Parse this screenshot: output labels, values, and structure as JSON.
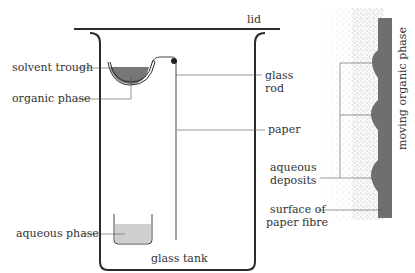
{
  "diagram": {
    "labels": {
      "lid": "lid",
      "solvent_trough": "solvent trough",
      "organic_phase": "organic phase",
      "glass_rod_line1": "glass",
      "glass_rod_line2": "rod",
      "paper": "paper",
      "aqueous_phase": "aqueous phase",
      "glass_tank": "glass tank",
      "aqueous_deposits_line1": "aqueous",
      "aqueous_deposits_line2": "deposits",
      "surface_line1": "surface of",
      "surface_line2": "paper fibre",
      "moving_organic_phase": "moving organic phase"
    },
    "colors": {
      "outline": "#2b2b2b",
      "organic_fill": "#777777",
      "aqueous_fill": "#cfcfcf",
      "fibre_band": "#6f6f6f",
      "deposit_fill": "#c8c8c8",
      "stipple": "#9a9a9a",
      "leader": "#555555"
    }
  }
}
